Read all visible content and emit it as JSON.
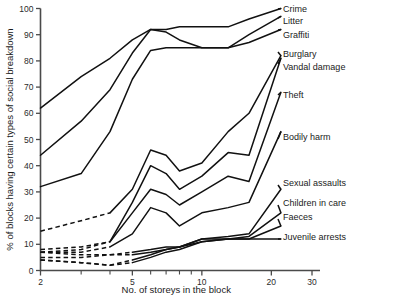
{
  "chart_data": {
    "type": "line",
    "title": "",
    "xlabel": "No. of storeys in the block",
    "ylabel": "% of blocks having certain types of social breakdown",
    "xscale": "log",
    "xlim": [
      2,
      30
    ],
    "ylim": [
      0,
      100
    ],
    "grid": false,
    "legend_position": "right",
    "xticks": [
      2,
      3,
      4,
      5,
      6,
      7,
      8,
      9,
      10,
      20,
      30
    ],
    "xtick_labels": [
      "2",
      "",
      "",
      "5",
      "",
      "",
      "",
      "",
      "10",
      "20",
      "30"
    ],
    "yticks": [
      0,
      10,
      20,
      30,
      40,
      50,
      60,
      70,
      80,
      90,
      100
    ],
    "ytick_labels": [
      "0",
      "10",
      "20",
      "30",
      "40",
      "50",
      "60",
      "70",
      "80",
      "90",
      "100"
    ],
    "series": [
      {
        "name": "Crime",
        "x": [
          2,
          3,
          4,
          5,
          6,
          7,
          8,
          10,
          13,
          16,
          22
        ],
        "values": [
          62,
          74,
          81,
          88,
          92,
          92,
          93,
          93,
          93,
          96,
          100
        ],
        "dashed_from": null
      },
      {
        "name": "Litter",
        "x": [
          2,
          3,
          4,
          5,
          6,
          7,
          8,
          10,
          13,
          16,
          22
        ],
        "values": [
          44,
          57,
          69,
          83,
          92,
          91,
          88,
          85,
          85,
          90,
          97
        ],
        "dashed_from": null
      },
      {
        "name": "Graffiti",
        "x": [
          2,
          3,
          4,
          5,
          6,
          7,
          8,
          10,
          13,
          16,
          22
        ],
        "values": [
          32,
          37,
          53,
          73,
          84,
          85,
          85,
          85,
          85,
          87,
          92
        ],
        "dashed_from": null
      },
      {
        "name": "Burglary",
        "x": [
          2,
          3,
          4,
          5,
          6,
          7,
          8,
          10,
          13,
          16,
          22
        ],
        "values": [
          15,
          19,
          22,
          31,
          46,
          44,
          38,
          41,
          53,
          60,
          82
        ],
        "dashed_from": 2
      },
      {
        "name": "Vandal damage",
        "x": [
          2,
          3,
          4,
          5,
          6,
          7,
          8,
          10,
          13,
          16,
          22
        ],
        "values": [
          8,
          9,
          11,
          26,
          40,
          37,
          31,
          36,
          45,
          44,
          81
        ],
        "dashed_from": 2
      },
      {
        "name": "Theft",
        "x": [
          2,
          3,
          4,
          5,
          6,
          7,
          8,
          10,
          13,
          16,
          22
        ],
        "values": [
          7,
          8,
          11,
          22,
          31,
          29,
          25,
          30,
          36,
          34,
          68
        ],
        "dashed_from": 2
      },
      {
        "name": "Bodily harm",
        "x": [
          2,
          3,
          4,
          5,
          6,
          7,
          8,
          10,
          13,
          16,
          22
        ],
        "values": [
          7,
          7,
          9,
          14,
          24,
          22,
          17,
          22,
          24,
          26,
          53
        ],
        "dashed_from": 2
      },
      {
        "name": "Sexual assaults",
        "x": [
          2,
          3,
          4,
          5,
          6,
          7,
          8,
          10,
          13,
          16,
          22
        ],
        "values": [
          7,
          6,
          6,
          7,
          8,
          9,
          9,
          12,
          13,
          14,
          31
        ],
        "dashed_from": 3
      },
      {
        "name": "Children in care",
        "x": [
          2,
          3,
          4,
          5,
          6,
          7,
          8,
          10,
          13,
          16,
          22
        ],
        "values": [
          5,
          5,
          6,
          6,
          7,
          8,
          9,
          11,
          12,
          13,
          22
        ],
        "dashed_from": 3
      },
      {
        "name": "Faeces",
        "x": [
          2,
          3,
          4,
          5,
          6,
          7,
          8,
          10,
          13,
          16,
          22
        ],
        "values": [
          4,
          3,
          2,
          4,
          6,
          8,
          9,
          12,
          12,
          12,
          17
        ],
        "dashed_from": 3
      },
      {
        "name": "Juvenile arrests",
        "x": [
          2,
          3,
          4,
          5,
          6,
          7,
          8,
          10,
          13,
          16,
          22
        ],
        "values": [
          4,
          3,
          2,
          3,
          5,
          7,
          8,
          11,
          12,
          12,
          12
        ],
        "dashed_from": 3
      }
    ]
  },
  "legend": {
    "items": [
      {
        "label": "Crime",
        "y": 12,
        "anchor_x": 278,
        "anchor_y": 9
      },
      {
        "label": "Litter",
        "y": 24,
        "anchor_x": 278,
        "anchor_y": 18
      },
      {
        "label": "Graffiti",
        "y": 38,
        "anchor_x": 278,
        "anchor_y": 30
      },
      {
        "label": "Burglary",
        "y": 57,
        "anchor_x": 278,
        "anchor_y": 52
      },
      {
        "label": "Vandal damage",
        "y": 70,
        "anchor_x": 278,
        "anchor_y": 64
      },
      {
        "label": "Theft",
        "y": 98,
        "anchor_x": 278,
        "anchor_y": 95
      },
      {
        "label": "Bodily harm",
        "y": 140,
        "anchor_x": 278,
        "anchor_y": 139
      },
      {
        "label": "Sexual assaults",
        "y": 186,
        "anchor_x": 278,
        "anchor_y": 185
      },
      {
        "label": "Children in care",
        "y": 206,
        "anchor_x": 278,
        "anchor_y": 205
      },
      {
        "label": "Faeces",
        "y": 220,
        "anchor_x": 278,
        "anchor_y": 219
      },
      {
        "label": "Juvenile arrests",
        "y": 240,
        "anchor_x": 278,
        "anchor_y": 239
      }
    ]
  }
}
